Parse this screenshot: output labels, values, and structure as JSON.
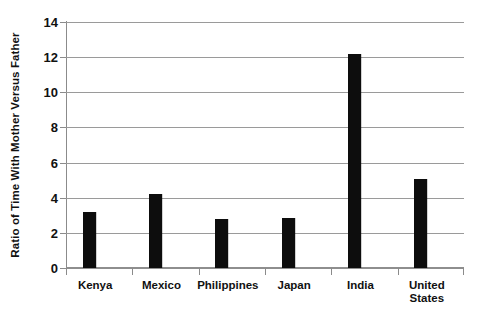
{
  "chart_data": {
    "type": "bar",
    "title": "",
    "subtitle": "",
    "xlabel": "",
    "ylabel": "Ratio of Time With Mother Versus Father",
    "categories": [
      "Kenya",
      "Mexico",
      "Philippines",
      "Japan",
      "India",
      "United States"
    ],
    "values": [
      3.2,
      4.2,
      2.8,
      2.85,
      12.2,
      5.05
    ],
    "series": [
      {
        "name": "Ratio of Time With Mother Versus Father",
        "values": [
          3.2,
          4.2,
          2.8,
          2.85,
          12.2,
          5.05
        ]
      }
    ],
    "ylim": [
      0,
      14
    ],
    "ytick_values": [
      0,
      2,
      4,
      6,
      8,
      10,
      12,
      14
    ],
    "ytick_labels": [
      "0",
      "2",
      "4",
      "6",
      "8",
      "10",
      "12",
      "14"
    ],
    "ytick_step": 2,
    "grid": true,
    "grid_axis": "y",
    "legend": false,
    "legend_position": "none",
    "bar_color": "#0d0d0d",
    "grid_color": "#9a9a9a",
    "axis_color": "#8b8b8b",
    "background_color": "#ffffff",
    "text_color": "#111111",
    "annotations": []
  }
}
